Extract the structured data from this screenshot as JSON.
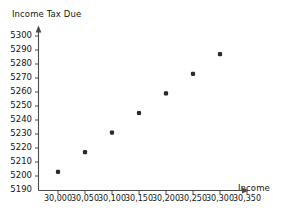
{
  "chart_data": {
    "type": "scatter",
    "title": "",
    "xlabel": "Income",
    "ylabel": "Income Tax Due",
    "xlim": [
      29975,
      30375
    ],
    "ylim": [
      5190,
      5303
    ],
    "grid": false,
    "legend": "none",
    "x_tick_labels": [
      "30,000",
      "30,050",
      "30,100",
      "30,150",
      "30,200",
      "30,250",
      "30,300",
      "30,350"
    ],
    "x_tick_values": [
      30000,
      30050,
      30100,
      30150,
      30200,
      30250,
      30300,
      30350
    ],
    "y_tick_labels": [
      "5300",
      "5290",
      "5280",
      "5270",
      "5260",
      "5250",
      "5240",
      "5230",
      "5220",
      "5210",
      "5200",
      "5190"
    ],
    "y_tick_values": [
      5300,
      5290,
      5280,
      5270,
      5260,
      5250,
      5240,
      5230,
      5220,
      5210,
      5200,
      5190
    ],
    "x": [
      30000,
      30050,
      30100,
      30150,
      30200,
      30250,
      30300
    ],
    "y": [
      5203,
      5217,
      5231,
      5245,
      5259,
      5273,
      5287
    ],
    "points": [
      {
        "x": 30000,
        "y": 5203
      },
      {
        "x": 30050,
        "y": 5217
      },
      {
        "x": 30100,
        "y": 5231
      },
      {
        "x": 30150,
        "y": 5245
      },
      {
        "x": 30200,
        "y": 5259
      },
      {
        "x": 30250,
        "y": 5273
      },
      {
        "x": 30300,
        "y": 5287
      }
    ],
    "marker_color": "#2b2b2b",
    "axis_color": "#4a4a4a",
    "background_color": "#ffffff"
  }
}
